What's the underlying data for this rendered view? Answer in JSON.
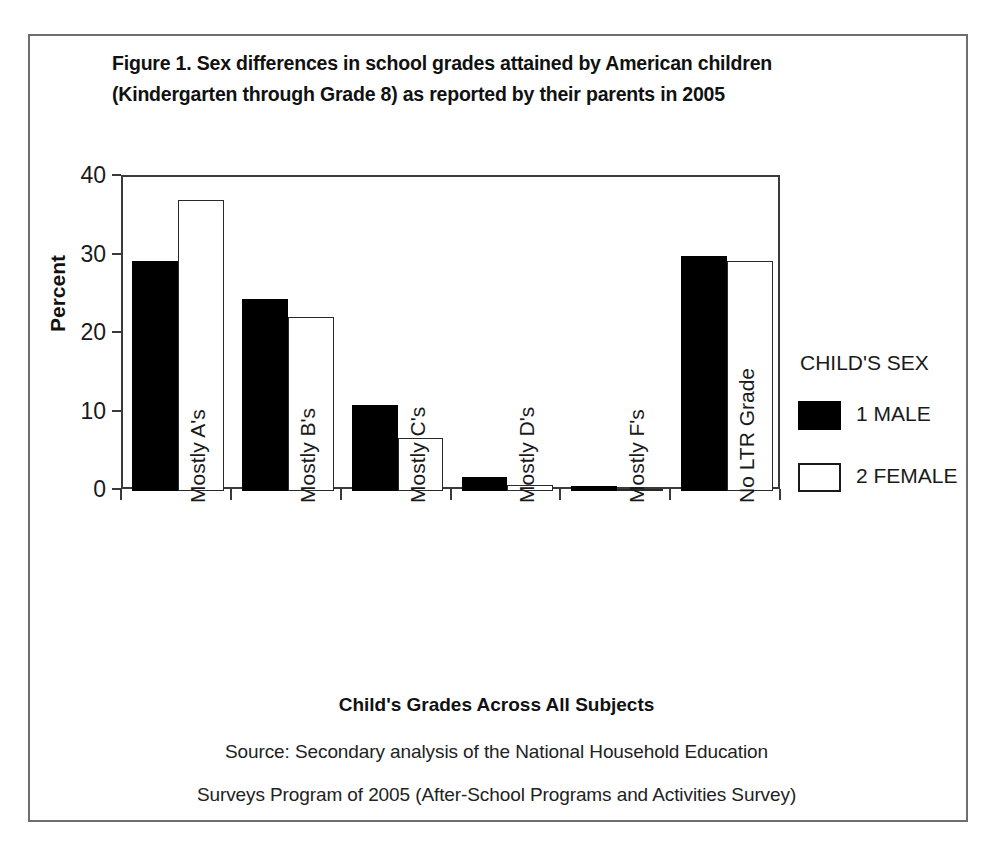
{
  "figure": {
    "title_line1": "Figure 1. Sex differences in school grades attained by American children",
    "title_line2": "(Kindergarten through Grade 8) as reported by their parents in 2005",
    "x_axis_title": "Child's Grades Across All Subjects",
    "source_line1": "Source: Secondary analysis of the National Household Education",
    "source_line2": "Surveys Program of 2005 (After-School Programs and Activities Survey)"
  },
  "legend": {
    "title": "CHILD'S SEX",
    "entries": [
      {
        "label": "1 MALE",
        "color": "#000000",
        "style": "filled"
      },
      {
        "label": "2 FEMALE",
        "color": "#ffffff",
        "style": "outlined"
      }
    ]
  },
  "chart_data": {
    "type": "bar",
    "title": "Figure 1. Sex differences in school grades attained by American children (Kindergarten through Grade 8) as reported by their parents in 2005",
    "xlabel": "Child's Grades Across All Subjects",
    "ylabel": "Percent",
    "ylim": [
      0,
      40
    ],
    "yticks": [
      0,
      10,
      20,
      30,
      40
    ],
    "ytick_labels": [
      "0",
      "10",
      "20",
      "30",
      "40"
    ],
    "grid": false,
    "legend_position": "right",
    "categories": [
      "Mostly A's",
      "Mostly B's",
      "Mostly C's",
      "Mostly D's",
      "Mostly F's",
      "No LTR Grade"
    ],
    "series": [
      {
        "name": "1 MALE",
        "color": "#000000",
        "values": [
          29.3,
          24.4,
          11.0,
          1.8,
          0.7,
          29.9
        ]
      },
      {
        "name": "2 FEMALE",
        "color": "#ffffff",
        "values": [
          37.1,
          22.2,
          6.7,
          0.8,
          0.3,
          29.3
        ]
      }
    ]
  }
}
